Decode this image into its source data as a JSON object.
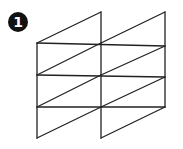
{
  "figure": {
    "label": "1",
    "stroke_color": "#222222",
    "badge_color": "#111111"
  },
  "geometry": {
    "left_column": {
      "x0": 37,
      "x1": 101
    },
    "right_column": {
      "x0": 101,
      "x1": 165
    },
    "verticals": [
      {
        "x": 37,
        "y0": 43,
        "y1": 138
      },
      {
        "x": 101,
        "y0": 12,
        "y1": 138
      },
      {
        "x": 165,
        "y0": 12,
        "y1": 107
      }
    ],
    "horizontals": [
      {
        "x0": 37,
        "x1": 165,
        "y0": 43,
        "y1": 46
      },
      {
        "x0": 37,
        "x1": 165,
        "y0": 75,
        "y1": 77
      },
      {
        "x0": 37,
        "x1": 165,
        "y0": 107,
        "y1": 107
      }
    ],
    "diagonals": [
      {
        "x0": 37,
        "y0": 43,
        "x1": 101,
        "y1": 12
      },
      {
        "x0": 37,
        "y0": 75,
        "x1": 101,
        "y1": 43
      },
      {
        "x0": 37,
        "y0": 107,
        "x1": 101,
        "y1": 75
      },
      {
        "x0": 37,
        "y0": 138,
        "x1": 101,
        "y1": 107
      },
      {
        "x0": 101,
        "y0": 43,
        "x1": 165,
        "y1": 12
      },
      {
        "x0": 101,
        "y0": 75,
        "x1": 165,
        "y1": 46
      },
      {
        "x0": 101,
        "y0": 107,
        "x1": 165,
        "y1": 77
      },
      {
        "x0": 101,
        "y0": 138,
        "x1": 165,
        "y1": 107
      }
    ]
  }
}
